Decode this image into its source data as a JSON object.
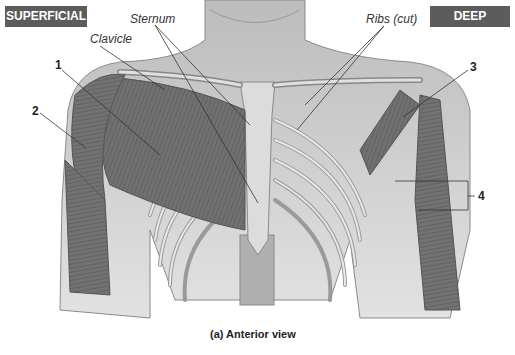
{
  "badges": {
    "left": "SUPERFICIAL",
    "right": "DEEP"
  },
  "structure_labels": {
    "clavicle": "Clavicle",
    "sternum": "Sternum",
    "ribs": "Ribs (cut)"
  },
  "numbered_labels": [
    "1",
    "2",
    "3",
    "4"
  ],
  "caption": "(a) Anterior view",
  "colors": {
    "badge_bg": "#5c5c5c",
    "badge_text": "#ffffff",
    "muscle": "#6e6e6e",
    "bone": "#d8d8d8",
    "skin": "#c9c9c9"
  }
}
